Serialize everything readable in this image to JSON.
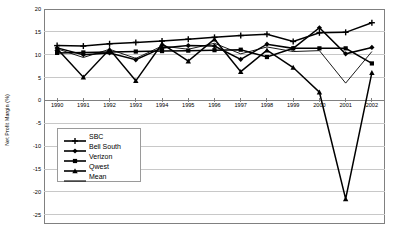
{
  "chart_data": {
    "type": "line",
    "title": "",
    "xlabel": "",
    "ylabel": "Net Profit Margin (%)",
    "x": [
      1990,
      1991,
      1992,
      1993,
      1994,
      1995,
      1996,
      1997,
      1998,
      1999,
      2000,
      2001,
      2002
    ],
    "xticklabels": [
      "1990",
      "1991",
      "1992",
      "1993",
      "1994",
      "1995",
      "1996",
      "1997",
      "1998",
      "1999",
      "2000",
      "2001",
      "2002"
    ],
    "yticklabels": [
      "20",
      "15",
      "10",
      "5",
      "0",
      "-5",
      "-10",
      "-15",
      "-20",
      "-25"
    ],
    "yticks": [
      20,
      15,
      10,
      5,
      0,
      -5,
      -10,
      -15,
      -20,
      -25
    ],
    "ylim": [
      -27,
      20
    ],
    "xlim": [
      1989.5,
      2002.5
    ],
    "grid": "horizontal",
    "legend_position": "inside-lower-left",
    "series": [
      {
        "name": "SBC",
        "marker": "plus",
        "values": [
          12.0,
          11.9,
          12.4,
          12.7,
          13.0,
          13.4,
          13.8,
          14.2,
          14.5,
          12.9,
          14.8,
          14.9,
          17.0
        ]
      },
      {
        "name": "Bell South",
        "marker": "diamond",
        "values": [
          11.5,
          10.0,
          10.4,
          8.9,
          11.5,
          12.0,
          11.9,
          9.0,
          12.3,
          11.4,
          15.9,
          10.2,
          11.6
        ]
      },
      {
        "name": "Verizon",
        "marker": "square",
        "values": [
          10.4,
          10.5,
          10.6,
          10.7,
          10.8,
          10.9,
          11.0,
          11.1,
          9.5,
          11.4,
          11.4,
          11.4,
          8.1
        ]
      },
      {
        "name": "Qwest",
        "marker": "triangle",
        "values": [
          11.3,
          5.1,
          11.2,
          4.3,
          12.4,
          8.6,
          13.4,
          6.3,
          11.0,
          7.2,
          1.8,
          -21.5,
          6.1
        ]
      },
      {
        "name": "Mean",
        "marker": "none",
        "values": [
          11.3,
          9.4,
          11.2,
          9.2,
          11.9,
          11.2,
          12.5,
          10.2,
          11.7,
          10.7,
          10.9,
          3.8,
          10.7
        ]
      }
    ]
  },
  "legend": {
    "items": [
      {
        "label": "SBC"
      },
      {
        "label": "Bell South"
      },
      {
        "label": "Verizon"
      },
      {
        "label": "Qwest"
      },
      {
        "label": "Mean"
      }
    ]
  },
  "axes": {
    "y_title": "Net Profit Margin (%)"
  },
  "colors": {
    "line": "#000000",
    "grid": "#c8c8c8",
    "axis": "#808080",
    "background": "#ffffff"
  }
}
